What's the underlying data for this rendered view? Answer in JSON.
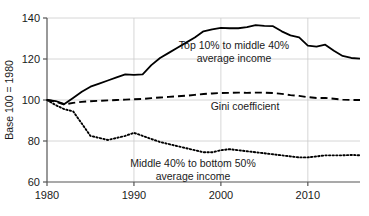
{
  "chart_data": {
    "type": "line",
    "title": "",
    "subtitle": "",
    "xlabel": "",
    "ylabel": "Base 100 = 1980",
    "xlim": [
      1980,
      2016
    ],
    "ylim": [
      60,
      140
    ],
    "grid": true,
    "legend_position": "inline-annotations",
    "xticks": [
      "1980",
      "1990",
      "2000",
      "2010"
    ],
    "xtick_values": [
      1980,
      1990,
      2000,
      2010
    ],
    "yticks": [
      "60",
      "80",
      "100",
      "120",
      "140"
    ],
    "ytick_values": [
      60,
      80,
      100,
      120,
      140
    ],
    "x": [
      1980,
      1981,
      1982,
      1983,
      1984,
      1985,
      1986,
      1987,
      1988,
      1989,
      1990,
      1991,
      1992,
      1993,
      1994,
      1995,
      1996,
      1997,
      1998,
      1999,
      2000,
      2001,
      2002,
      2003,
      2004,
      2005,
      2006,
      2007,
      2008,
      2009,
      2010,
      2011,
      2012,
      2013,
      2014,
      2015,
      2016
    ],
    "series": [
      {
        "name": "Top 10% to middle 40% average income",
        "style": "solid",
        "color": "#000000",
        "label_line1": "Top 10% to middle 40%",
        "label_line2": "average income",
        "values": [
          100,
          99.5,
          98,
          101,
          104,
          106.5,
          108,
          109.5,
          111,
          112.5,
          112.3,
          112.5,
          117,
          120.5,
          123,
          125.5,
          128,
          130.5,
          133.5,
          134.5,
          135.2,
          135,
          135,
          135.5,
          136.5,
          136.2,
          136,
          133.5,
          131.5,
          130.5,
          126.5,
          126,
          127,
          124,
          121.5,
          120.5,
          120.2
        ]
      },
      {
        "name": "Gini coefficient",
        "style": "dashed",
        "color": "#000000",
        "label_line1": "Gini coefficient",
        "label_line2": "",
        "values": [
          100,
          99.2,
          97.8,
          98.6,
          99.1,
          99.4,
          99.6,
          99.8,
          100.0,
          100.2,
          100.4,
          100.5,
          100.9,
          101.2,
          101.5,
          101.8,
          102.1,
          102.5,
          102.9,
          103.2,
          103.4,
          103.5,
          103.6,
          103.5,
          103.6,
          103.6,
          103.4,
          103.0,
          102.4,
          102.0,
          101.4,
          101.0,
          101.0,
          100.6,
          100.2,
          100.0,
          100.0
        ]
      },
      {
        "name": "Middle 40% to bottom 50% average income",
        "style": "dotted",
        "color": "#000000",
        "label_line1": "Middle 40% to bottom 50%",
        "label_line2": "average income",
        "values": [
          100,
          97.5,
          95.5,
          94.5,
          88.5,
          82.5,
          81.5,
          80.5,
          81.5,
          82.5,
          84,
          82.5,
          81,
          79.5,
          78.5,
          77.5,
          76.5,
          75.5,
          74.5,
          74.5,
          75.5,
          76,
          75.5,
          75,
          74.5,
          74,
          73.5,
          73,
          72.5,
          72,
          72,
          72.5,
          73,
          73,
          73,
          73.2,
          73
        ]
      }
    ]
  },
  "axis": {
    "y_title": "Base 100 = 1980"
  }
}
